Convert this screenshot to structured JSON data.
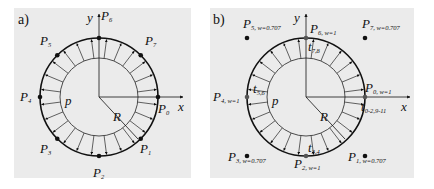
{
  "panels": [
    {
      "tag": "a)",
      "axis_x": "x",
      "axis_y": "y",
      "inner_label": "p",
      "radius_label": "R",
      "points": [
        {
          "name": "P",
          "sub": "0",
          "angle_deg": 0
        },
        {
          "name": "P",
          "sub": "1",
          "angle_deg": -45
        },
        {
          "name": "P",
          "sub": "2",
          "angle_deg": -90
        },
        {
          "name": "P",
          "sub": "3",
          "angle_deg": -135
        },
        {
          "name": "P",
          "sub": "4",
          "angle_deg": 180
        },
        {
          "name": "P",
          "sub": "5",
          "angle_deg": 135
        },
        {
          "name": "P",
          "sub": "6",
          "angle_deg": 90
        },
        {
          "name": "P",
          "sub": "7",
          "angle_deg": 45
        }
      ],
      "pressure_arrow_count": 24
    },
    {
      "tag": "b)",
      "axis_x": "x",
      "axis_y": "y",
      "inner_label": "p",
      "radius_label": "R",
      "control_points": [
        {
          "name": "P",
          "sub": "0, w=1",
          "weight": 1
        },
        {
          "name": "P",
          "sub": "1, w=0.707",
          "weight": 0.707
        },
        {
          "name": "P",
          "sub": "2, w=1",
          "weight": 1
        },
        {
          "name": "P",
          "sub": "3, w=0.707",
          "weight": 0.707
        },
        {
          "name": "P",
          "sub": "4, w=1",
          "weight": 1
        },
        {
          "name": "P",
          "sub": "5, w=0.707",
          "weight": 0.707
        },
        {
          "name": "P",
          "sub": "6, w=1",
          "weight": 1
        },
        {
          "name": "P",
          "sub": "7, w=0.707",
          "weight": 0.707
        }
      ],
      "knot_labels": [
        {
          "name": "t",
          "sub": "0-2,9-11"
        },
        {
          "name": "t",
          "sub": "3,4"
        },
        {
          "name": "t",
          "sub": "5,6"
        },
        {
          "name": "t",
          "sub": "7,8"
        }
      ],
      "pressure_arrow_count": 24
    }
  ]
}
